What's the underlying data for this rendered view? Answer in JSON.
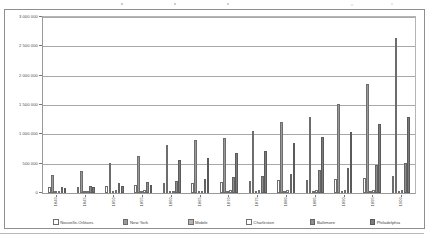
{
  "chart_data": {
    "type": "bar",
    "title": "",
    "subtitle": "",
    "xlabel": "",
    "ylabel": "",
    "ylim": [
      0,
      3000000
    ],
    "ytick_labels": [
      "3 000 000",
      "2 500 000",
      "2 000 000",
      "1 500 000",
      "1 000 000",
      "500 000",
      "0"
    ],
    "ytick_values": [
      3000000,
      2500000,
      2000000,
      1500000,
      1000000,
      500000,
      0
    ],
    "grid": true,
    "legend_position": "bottom",
    "categories": [
      "1840",
      "1845",
      "1850",
      "1855",
      "1860",
      "1865",
      "1870",
      "1875",
      "1880",
      "1885",
      "1890",
      "1895",
      "1900"
    ],
    "series": [
      {
        "name": "Nouvelle-Orléans",
        "color": "#ffffff",
        "values": [
          102193,
          110000,
          116375,
          140000,
          168675,
          175000,
          191418,
          205000,
          216090,
          228000,
          242039,
          262000,
          287104
        ]
      },
      {
        "name": "New York",
        "color": "#9a9a9a",
        "values": [
          312710,
          371000,
          515547,
          630000,
          813669,
          900000,
          942292,
          1050000,
          1206299,
          1300000,
          1515301,
          1850000,
          2650000
        ]
      },
      {
        "name": "Mobile",
        "color": "#b4b4b4",
        "values": [
          12672,
          15000,
          20515,
          23000,
          29258,
          30000,
          32034,
          33000,
          29132,
          31000,
          31076,
          36000,
          38469
        ]
      },
      {
        "name": "Charleston",
        "color": "#fdfdfd",
        "values": [
          29261,
          31000,
          42985,
          45000,
          40522,
          42000,
          48956,
          50000,
          49984,
          53000,
          54955,
          56000,
          55807
        ]
      },
      {
        "name": "Baltimore",
        "color": "#8e8e8e",
        "values": [
          102313,
          120000,
          169054,
          190000,
          212418,
          235000,
          267354,
          290000,
          332313,
          385000,
          434439,
          480000,
          508957
        ]
      },
      {
        "name": "Philadelphia",
        "color": "#7c7c7c",
        "values": [
          93665,
          110000,
          121376,
          145000,
          565529,
          600000,
          674022,
          720000,
          847170,
          950000,
          1046964,
          1180000,
          1293697
        ]
      }
    ]
  },
  "legend": {
    "items": [
      {
        "label": "Nouvelle-Orléans",
        "swatch_class": "s0"
      },
      {
        "label": "New York",
        "swatch_class": "s1"
      },
      {
        "label": "Mobile",
        "swatch_class": "s2"
      },
      {
        "label": "Charleston",
        "swatch_class": "s3"
      },
      {
        "label": "Baltimore",
        "swatch_class": "s4"
      },
      {
        "label": "Philadelphia",
        "swatch_class": "s5"
      }
    ]
  }
}
